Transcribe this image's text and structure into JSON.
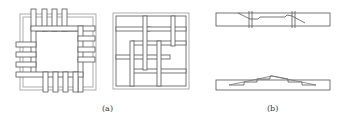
{
  "figure": {
    "panels": [
      {
        "id": "a",
        "label": "(a)",
        "description": "Two square grid layouts: pinwheel arrangement of bars around a central opening, and interwoven lattice"
      },
      {
        "id": "b",
        "label": "(b)",
        "description": "Two beam elevations: stepped/scarfed joint beam and a beam with stepped pitched profile"
      }
    ]
  },
  "colors": {
    "stroke": "#555555",
    "stroke_light": "#999999",
    "background": "#ffffff",
    "text": "#333333"
  }
}
